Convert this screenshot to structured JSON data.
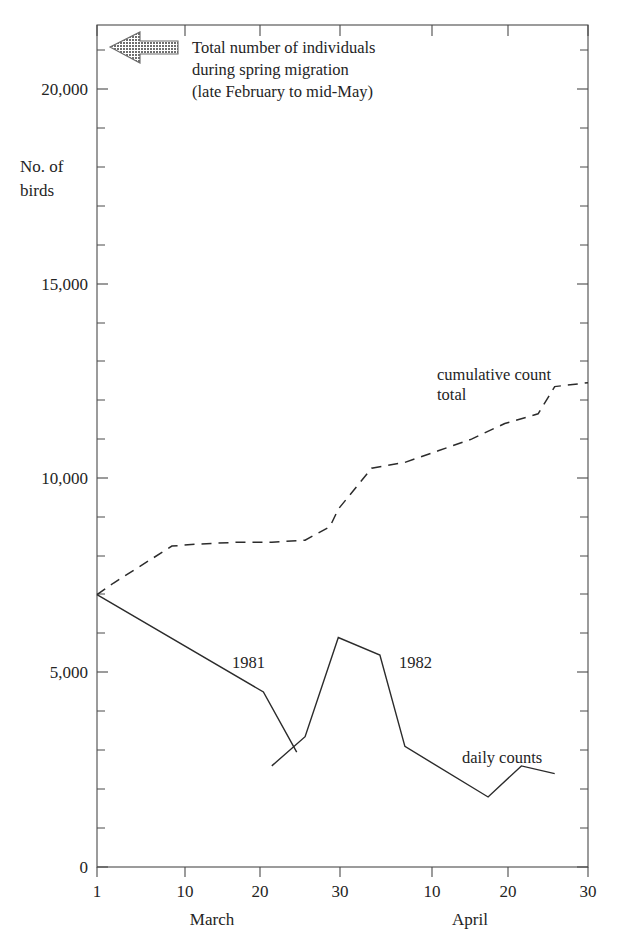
{
  "chart_data": {
    "type": "line",
    "title": "",
    "xlabel": "",
    "ylabel": "No. of birds",
    "ylim": [
      0,
      21500
    ],
    "yticks": [
      0,
      5000,
      10000,
      15000,
      20000
    ],
    "ytick_labels": [
      "0",
      "5,000",
      "10,000",
      "15,000",
      "20,000"
    ],
    "y_minor_tick_interval": 1000,
    "grid": false,
    "legend": "inline annotations",
    "x_axis": {
      "type": "date",
      "months": [
        {
          "name": "March",
          "ticks": [
            1,
            10,
            20,
            30
          ]
        },
        {
          "name": "April",
          "ticks": [
            10,
            20,
            30
          ]
        }
      ],
      "tick_labels": [
        "1",
        "10",
        "20",
        "30",
        "10",
        "20",
        "30"
      ],
      "month_labels": [
        "March",
        "April"
      ],
      "range_days": [
        1,
        60
      ]
    },
    "annotations": [
      {
        "name": "total-individuals-note",
        "lines": [
          "Total number of individuals",
          "during spring migration",
          "(late February to mid-May)"
        ],
        "arrow": "left-arrow-stippled",
        "arrow_color": "#7a7a7a"
      }
    ],
    "series": [
      {
        "name": "cumulative count total",
        "label": "cumulative count total",
        "label_lines": [
          "cumulative count",
          "total"
        ],
        "style": "dashed",
        "color": "#2b2b2b",
        "x_days": [
          1,
          3,
          10,
          13,
          18,
          22,
          26,
          29,
          30,
          34,
          38,
          42,
          46,
          50,
          54,
          56,
          60
        ],
        "x_dates": [
          "Mar 1",
          "Mar 3",
          "Mar 10",
          "Mar 13",
          "Mar 18",
          "Mar 22",
          "Mar 26",
          "Mar 29",
          "Mar 30",
          "Apr 3",
          "Apr 7",
          "Apr 11",
          "Apr 15",
          "Apr 19",
          "Apr 23",
          "Apr 25",
          "Apr 29"
        ],
        "y_values": [
          7000,
          7300,
          8250,
          8300,
          8350,
          8350,
          8400,
          8750,
          9200,
          10250,
          10400,
          10700,
          11000,
          11400,
          11650,
          12350,
          12450
        ]
      },
      {
        "name": "daily counts 1981",
        "label": "1981",
        "style": "solid",
        "color": "#2b2b2b",
        "x_days": [
          1,
          21,
          25
        ],
        "x_dates": [
          "Mar 1",
          "Mar 21",
          "Mar 25"
        ],
        "y_values": [
          7000,
          4500,
          2950
        ]
      },
      {
        "name": "daily counts 1982",
        "label": "1982",
        "style": "solid",
        "color": "#2b2b2b",
        "x_days": [
          22,
          26,
          30,
          35,
          38,
          48,
          52,
          56
        ],
        "x_dates": [
          "Mar 22",
          "Mar 26",
          "Mar 30",
          "Apr 4",
          "Apr 7",
          "Apr 17",
          "Apr 21",
          "Apr 25"
        ],
        "y_values": [
          2600,
          3350,
          5900,
          5450,
          3100,
          1800,
          2600,
          2400
        ]
      }
    ],
    "series_labels": [
      {
        "text": "1981",
        "x_day": 19,
        "y_value": 5350
      },
      {
        "text": "1982",
        "x_day": 38,
        "y_value": 5350
      },
      {
        "text": "daily counts",
        "x_day": 51,
        "y_value": 2950
      }
    ]
  }
}
